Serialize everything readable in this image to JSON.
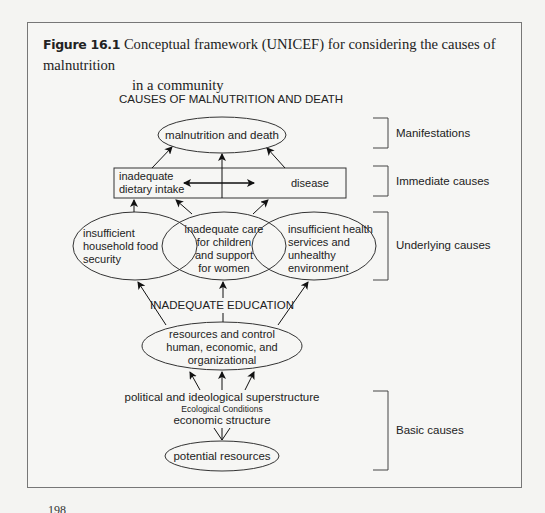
{
  "figure": {
    "number": "Figure 16.1",
    "caption_line1": "Conceptual framework (UNICEF) for considering the causes of malnutrition",
    "caption_line2": "in a community"
  },
  "diagram": {
    "title": "CAUSES OF MALNUTRITION AND DEATH",
    "manifestation": "malnutrition and death",
    "immediate": {
      "left_line1": "inadequate",
      "left_line2": "dietary intake",
      "right": "disease"
    },
    "underlying": {
      "food": [
        "insufficient",
        "household food",
        "security"
      ],
      "care": [
        "inadequate care",
        "for children",
        "and support",
        "for women"
      ],
      "health": [
        "insufficient health",
        "services and",
        "unhealthy",
        "environment"
      ]
    },
    "education": "INADEQUATE EDUCATION",
    "resources": [
      "resources and control",
      "human, economic, and",
      "organizational"
    ],
    "superstructure": "political and ideological superstructure",
    "ecological": "Ecological Conditions",
    "economic": "economic structure",
    "potential": "potential resources",
    "levels": {
      "manifestations": "Manifestations",
      "immediate": "Immediate causes",
      "underlying": "Underlying causes",
      "basic": "Basic causes"
    }
  },
  "page_number": "198"
}
